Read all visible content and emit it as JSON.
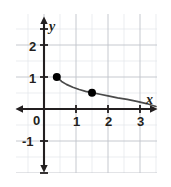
{
  "figure": {
    "width": 171,
    "height": 187,
    "background": "#ffffff"
  },
  "chart_data": {
    "type": "line",
    "title": "",
    "subtitle": "",
    "xlabel": "x",
    "ylabel": "y",
    "grid": true,
    "legend": "none",
    "xlim": [
      -0.9,
      4.0
    ],
    "ylim": [
      -1.9,
      2.9
    ],
    "x_ticks": [
      1,
      2,
      3
    ],
    "x_tick_labels": [
      "1",
      "2",
      "3"
    ],
    "y_ticks": [
      -1,
      1,
      2
    ],
    "y_tick_labels": [
      "-1",
      "1",
      "2"
    ],
    "origin_label": "0",
    "minor_grid_step": 0.5,
    "major_unit": 1,
    "curve": {
      "name": "decreasing power curve",
      "x_start": 0.4,
      "x_end": 3.5,
      "points_x": [
        0.4,
        0.55,
        0.7,
        0.9,
        1.1,
        1.3,
        1.5,
        1.75,
        2.0,
        2.3,
        2.6,
        2.9,
        3.2,
        3.5
      ],
      "points_y": [
        1.0,
        0.86,
        0.77,
        0.68,
        0.61,
        0.55,
        0.51,
        0.46,
        0.41,
        0.35,
        0.3,
        0.24,
        0.17,
        0.08
      ]
    },
    "marked_points": [
      {
        "label": "",
        "x": 0.4,
        "y": 1.0
      },
      {
        "label": "",
        "x": 1.5,
        "y": 0.51
      }
    ],
    "colors": {
      "axis": "#231f20",
      "curve": "#4a4a4a",
      "point": "#000000",
      "major_grid": "#bfc3c9",
      "minor_grid": "#e2e5e9",
      "tick_text": "#231f20"
    }
  },
  "labels": {
    "x_axis_name": "x",
    "y_axis_name": "y",
    "origin": "0",
    "x1": "1",
    "x2": "2",
    "x3": "3",
    "y1": "1",
    "y2": "2",
    "yneg1": "-1"
  }
}
